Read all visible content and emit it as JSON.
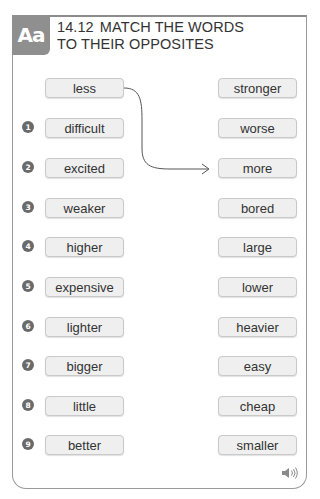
{
  "header": {
    "badge": "Aa",
    "exercise_number": "14.12",
    "title_line1": "MATCH THE WORDS",
    "title_line2": "TO THEIR OPPOSITES"
  },
  "example": {
    "left": "less",
    "right_match": "more"
  },
  "left_words": [
    {
      "num": "1",
      "word": "difficult"
    },
    {
      "num": "2",
      "word": "excited"
    },
    {
      "num": "3",
      "word": "weaker"
    },
    {
      "num": "4",
      "word": "higher"
    },
    {
      "num": "5",
      "word": "expensive"
    },
    {
      "num": "6",
      "word": "lighter"
    },
    {
      "num": "7",
      "word": "bigger"
    },
    {
      "num": "8",
      "word": "little"
    },
    {
      "num": "9",
      "word": "better"
    }
  ],
  "right_words": [
    "stronger",
    "worse",
    "more",
    "bored",
    "large",
    "lower",
    "heavier",
    "easy",
    "cheap",
    "smaller"
  ],
  "audio_icon": "speaker-icon",
  "colors": {
    "badge": "#8f8f8f",
    "box_fill": "#efefef",
    "border": "#9a9a9a"
  }
}
